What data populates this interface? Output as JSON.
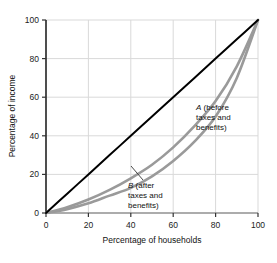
{
  "chart_data": {
    "type": "line",
    "title": "",
    "subtitle": "",
    "xlabel": "Percentage of households",
    "ylabel": "Percentage of income",
    "xlim": [
      0,
      100
    ],
    "ylim": [
      0,
      100
    ],
    "xticks": [
      "0",
      "20",
      "40",
      "60",
      "80",
      "100"
    ],
    "yticks": [
      "0",
      "20",
      "40",
      "60",
      "80",
      "100"
    ],
    "xtick_values": [
      0,
      20,
      40,
      60,
      80,
      100
    ],
    "ytick_values": [
      0,
      20,
      40,
      60,
      80,
      100
    ],
    "grid": true,
    "grid_color": "#d9d9d9",
    "legend_position": "inline-annotations",
    "x": [
      0,
      10,
      20,
      30,
      40,
      50,
      60,
      70,
      80,
      90,
      100
    ],
    "series": [
      {
        "name": "Line of equality",
        "color": "#000000",
        "width": 2.0,
        "values": [
          0,
          10,
          20,
          30,
          40,
          50,
          60,
          70,
          80,
          90,
          100
        ]
      },
      {
        "name": "A (before taxes and benefits)",
        "color": "#9a9a9a",
        "width": 2.6,
        "values": [
          0,
          3,
          7,
          12,
          18,
          25,
          34,
          45,
          58,
          76,
          100
        ]
      },
      {
        "name": "B (after taxes and benefits)",
        "color": "#9a9a9a",
        "width": 2.6,
        "values": [
          0,
          2,
          5,
          9,
          13,
          19,
          27,
          37,
          50,
          70,
          100
        ]
      }
    ],
    "annotations": [
      {
        "id": "label-a",
        "lines": [
          "A (before",
          "taxes and",
          "benefits)"
        ],
        "italic_prefix": "A",
        "x_px": 196,
        "y_px": 104
      },
      {
        "id": "label-b",
        "lines": [
          "B (after",
          "taxes and",
          "benefits)"
        ],
        "italic_prefix": "B",
        "x_px": 128,
        "y_px": 183,
        "leader_from": [
          143,
          180
        ],
        "leader_to": [
          131,
          166
        ]
      }
    ]
  },
  "axes": {
    "x_title": "Percentage of households",
    "y_title": "Percentage of income"
  }
}
